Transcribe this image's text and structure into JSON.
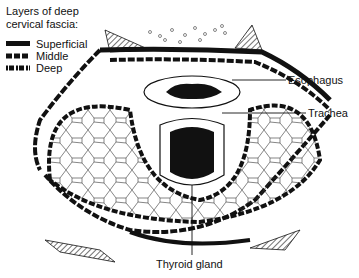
{
  "legend": {
    "title_line1": "Layers of deep",
    "title_line2": "cervical fascia:",
    "items": [
      {
        "label": "Superficial",
        "style": "solid"
      },
      {
        "label": "Middle",
        "style": "dashed"
      },
      {
        "label": "Deep",
        "style": "dotted-dash"
      }
    ]
  },
  "labels": {
    "esophagus": "Esophagus",
    "trachea": "Trachea",
    "thyroid": "Thyroid gland"
  },
  "colors": {
    "ink": "#111111",
    "background": "#ffffff"
  }
}
